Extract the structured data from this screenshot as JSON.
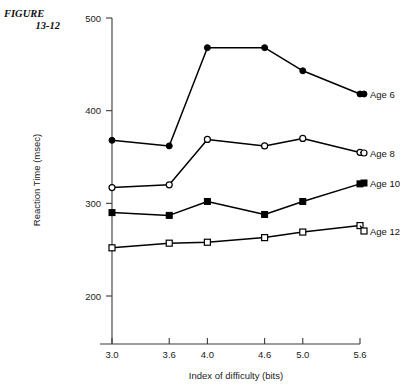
{
  "figure": {
    "caption_line1": "FIGURE",
    "caption_line2": "13-12"
  },
  "chart_data": {
    "type": "line",
    "title": "",
    "xlabel": "Index of difficulty (bits)",
    "ylabel": "Reaction Time (msec)",
    "x": [
      3.0,
      3.6,
      4.0,
      4.6,
      5.0,
      5.6
    ],
    "xticklabels": [
      "3.0",
      "3.6",
      "4.0",
      "4.6",
      "5.0",
      "5.6"
    ],
    "yticks": [
      200,
      300,
      400,
      500
    ],
    "yticklabels": [
      "200",
      "300",
      "400",
      "500"
    ],
    "xlim": [
      3.0,
      5.6
    ],
    "ylim": [
      170,
      500
    ],
    "grid": false,
    "legend_position": "right-of-plot-inline",
    "series": [
      {
        "name": "Age  6",
        "marker": "filled-circle",
        "color": "#000000",
        "values": [
          368,
          362,
          468,
          468,
          443,
          418
        ]
      },
      {
        "name": "Age  8",
        "marker": "open-circle",
        "color": "#000000",
        "values": [
          317,
          320,
          369,
          362,
          370,
          355
        ]
      },
      {
        "name": "Age 10",
        "marker": "filled-square",
        "color": "#000000",
        "values": [
          290,
          287,
          302,
          288,
          302,
          321
        ]
      },
      {
        "name": "Age 12",
        "marker": "open-square",
        "color": "#000000",
        "values": [
          252,
          257,
          258,
          263,
          269,
          276
        ]
      }
    ]
  }
}
